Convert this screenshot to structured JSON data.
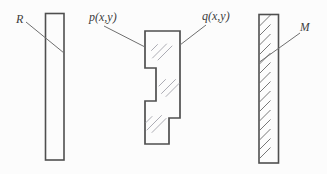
{
  "figure": {
    "labels": {
      "r": "R",
      "p": "p(x,y)",
      "q": "q(x,y)",
      "m": "M"
    },
    "colors": {
      "background": "#fcfcfc",
      "outline": "#4f4f4f",
      "leader": "#6f6f6f",
      "glass_hatch": "#a3a3ab",
      "mirror_hatch": "#686868"
    }
  }
}
